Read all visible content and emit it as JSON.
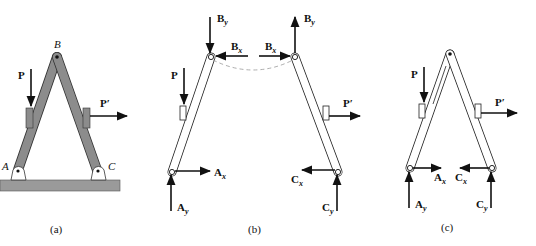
{
  "diagram": {
    "type": "free-body diagram",
    "panels": [
      {
        "id": "a",
        "caption": "(a)",
        "points": {
          "A": "A",
          "B": "B",
          "C": "C"
        },
        "loads": {
          "P": "P",
          "P_prime": "P′"
        }
      },
      {
        "id": "b",
        "caption": "(b)",
        "loads": {
          "P": "P",
          "P_prime": "P′"
        },
        "forces": {
          "By_left": {
            "main": "B",
            "sub": "y"
          },
          "By_right": {
            "main": "B",
            "sub": "y"
          },
          "Bx_left": {
            "main": "B",
            "sub": "x"
          },
          "Bx_right": {
            "main": "B",
            "sub": "x"
          },
          "Ax": {
            "main": "A",
            "sub": "x"
          },
          "Ay": {
            "main": "A",
            "sub": "y"
          },
          "Cx": {
            "main": "C",
            "sub": "x"
          },
          "Cy": {
            "main": "C",
            "sub": "y"
          }
        }
      },
      {
        "id": "c",
        "caption": "(c)",
        "loads": {
          "P": "P",
          "P_prime": "P′"
        },
        "forces": {
          "Ax": {
            "main": "A",
            "sub": "x"
          },
          "Ay": {
            "main": "A",
            "sub": "y"
          },
          "Cx": {
            "main": "C",
            "sub": "x"
          },
          "Cy": {
            "main": "C",
            "sub": "y"
          }
        }
      }
    ],
    "colors": {
      "member_fill": "#8c8c8c",
      "ground": "#9a9a9a",
      "ink": "#111111",
      "dash": "#999999"
    }
  }
}
